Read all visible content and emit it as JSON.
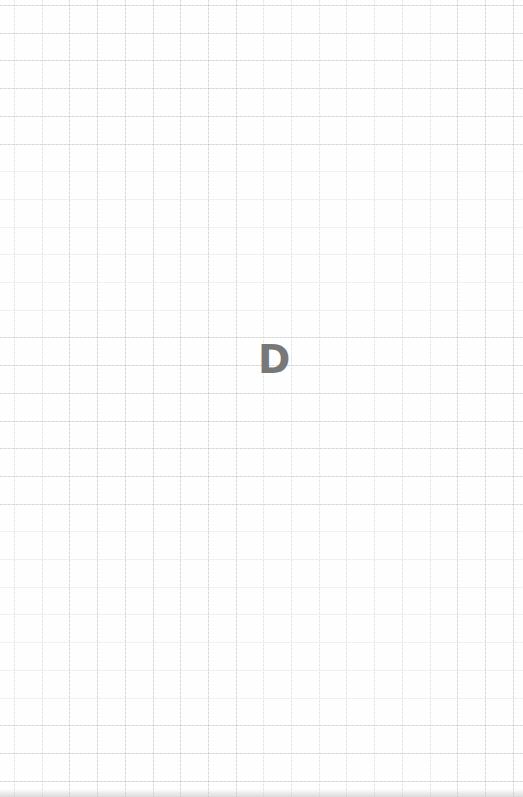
{
  "page": {
    "background": "grid-paper",
    "grid_color": "#b4b4b4",
    "grid_spacing_px": 27.7
  },
  "center_mark": {
    "text": "D",
    "color": "#787878"
  }
}
